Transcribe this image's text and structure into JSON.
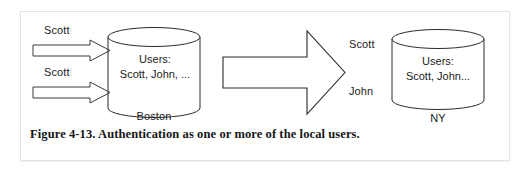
{
  "figure": {
    "caption": "Figure 4-13. Authentication as one or more of the local users.",
    "left_requests": [
      {
        "label": "Scott",
        "icon": "right-arrow-icon"
      },
      {
        "label": "Scott",
        "icon": "right-arrow-icon"
      }
    ],
    "center_flow": {
      "icon": "large-right-arrow-icon",
      "mapped_users": [
        "Scott",
        "John"
      ]
    },
    "databases": [
      {
        "name": "Boston",
        "icon": "database-cylinder-icon",
        "heading": "Users:",
        "users": "Scott, John, ..."
      },
      {
        "name": "NY",
        "icon": "database-cylinder-icon",
        "heading": "Users:",
        "users": "Scott, John..."
      }
    ],
    "colors": {
      "stroke": "#2b2b2b",
      "text": "#1b1b1b",
      "panel_border": "#e3e3e3",
      "background": "#ffffff"
    }
  }
}
